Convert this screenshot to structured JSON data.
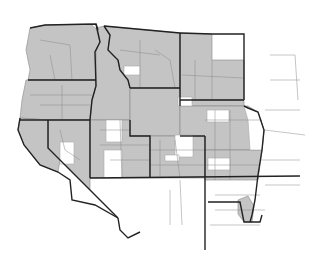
{
  "map": {
    "type": "choropleth",
    "region": "Western United States",
    "legend": null,
    "colors": {
      "shaded": "#c4c4c4",
      "unshaded": "#ffffff",
      "state_border": "#222222",
      "county_border": "#8a8a8a"
    },
    "states": [
      {
        "name": "Washington",
        "shaded": true
      },
      {
        "name": "Oregon",
        "shaded": true
      },
      {
        "name": "Idaho",
        "shaded": true
      },
      {
        "name": "Montana",
        "shaded": true
      },
      {
        "name": "North Dakota",
        "shaded": "partial"
      },
      {
        "name": "California",
        "shaded": "partial"
      },
      {
        "name": "Nevada",
        "shaded": "partial"
      },
      {
        "name": "Utah",
        "shaded": true
      },
      {
        "name": "Wyoming",
        "shaded": true
      },
      {
        "name": "South Dakota",
        "shaded": "partial"
      },
      {
        "name": "Colorado",
        "shaded": "partial"
      },
      {
        "name": "Nebraska",
        "shaded": "partial"
      },
      {
        "name": "Arizona",
        "shaded": false
      },
      {
        "name": "New Mexico",
        "shaded": "partial"
      },
      {
        "name": "Kansas",
        "shaded": "partial"
      }
    ]
  }
}
